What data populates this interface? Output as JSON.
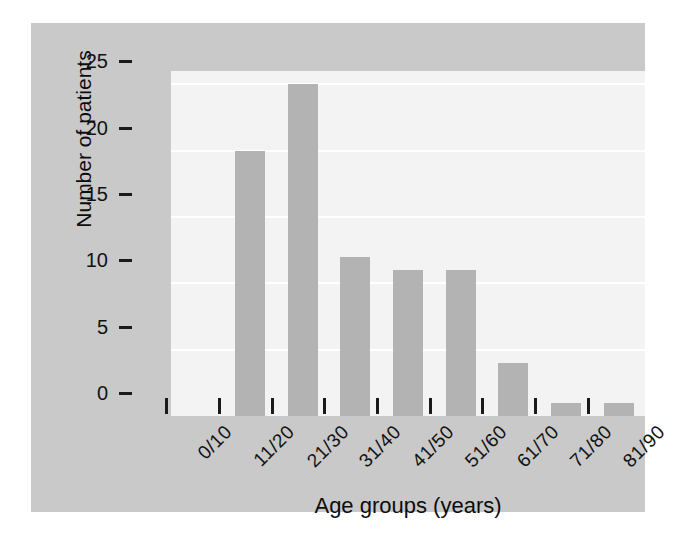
{
  "chart_data": {
    "type": "bar",
    "title": "",
    "subtitle": "",
    "xlabel": "Age groups (years)",
    "ylabel": "Number of patients",
    "categories": [
      "0/10",
      "11/20",
      "21/30",
      "31/40",
      "41/50",
      "51/60",
      "61/70",
      "71/80",
      "81/90"
    ],
    "values": [
      0,
      20,
      25,
      12,
      11,
      11,
      4,
      1,
      1
    ],
    "ylim": [
      0,
      26
    ],
    "yticks": [
      0,
      5,
      10,
      15,
      20,
      25
    ],
    "ytick_labels": [
      "0",
      "5",
      "10",
      "15",
      "20",
      "25"
    ],
    "grid": true,
    "grid_axis": "y",
    "legend": false,
    "legend_position": "none",
    "annotations": [],
    "colors": {
      "bar": "#b3b3b3",
      "plot_background": "#f3f3f3",
      "panel_background": "#c9c9c9",
      "page_background": "#ffffff",
      "gridline": "#ffffff",
      "axis_text": "#111111"
    }
  }
}
